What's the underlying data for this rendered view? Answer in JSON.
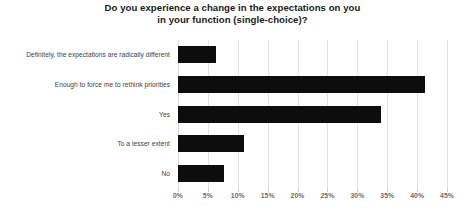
{
  "chart_data": {
    "type": "bar",
    "orientation": "horizontal",
    "title": "Do you experience a change in the expectations on you in your function (single-choice)?",
    "title_lines": [
      "Do you experience a change in the expectations on you",
      "in your function (single-choice)?"
    ],
    "categories": [
      "Definitely, the expectations are radically different",
      "Enough to force me to rethink priorities",
      "Yes",
      "To a lesser extent",
      "No"
    ],
    "values": [
      6.4,
      41.4,
      34.0,
      11.0,
      7.7
    ],
    "value_unit": "%",
    "xlabel": "",
    "ylabel": "",
    "xlim": [
      0,
      45
    ],
    "xticks": [
      0,
      5,
      10,
      15,
      20,
      25,
      30,
      35,
      40,
      45
    ],
    "xtick_labels": [
      "0%",
      "5%",
      "10%",
      "15%",
      "20%",
      "25%",
      "30%",
      "35%",
      "40%",
      "45%"
    ],
    "grid": true,
    "grid_axis": "x",
    "legend": false,
    "bar_color": "#0d0d0d",
    "gridline_color": "#e3e3e3",
    "tick_label_color": "#6b6b6b",
    "category_label_color": "#3d3d3d",
    "title_color": "#1a1a1a",
    "background_color": "#ffffff"
  }
}
